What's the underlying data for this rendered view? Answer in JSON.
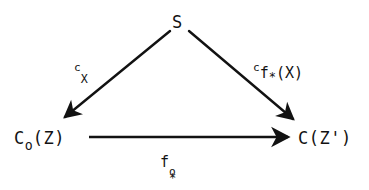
{
  "diagram": {
    "type": "commutative-triangle",
    "background_color": "#ffffff",
    "ink_color": "#121212",
    "nodes": [
      {
        "id": "top",
        "label_plain": "S",
        "base": "S",
        "position": {
          "x": 178,
          "y": 22
        }
      },
      {
        "id": "bottom-left",
        "label_plain": "C_o(Z)",
        "base": "C",
        "sub": "o",
        "tail": "(Z)",
        "position": {
          "x": 48,
          "y": 140
        }
      },
      {
        "id": "bottom-right",
        "label_plain": "C(Z')",
        "base": "C(Z')",
        "position": {
          "x": 330,
          "y": 140
        }
      }
    ],
    "arrows": [
      {
        "id": "left",
        "from": "top",
        "to": "bottom-left",
        "label_plain": "c_X",
        "presup": "c",
        "sub": "X",
        "head": "arrowhead-down-left"
      },
      {
        "id": "right",
        "from": "top",
        "to": "bottom-right",
        "label_plain": "c_{f_*(X)}",
        "presup": "c",
        "sub_base": "f",
        "sub_star": "*",
        "sub_tail": "(X)",
        "head": "arrowhead-down-right"
      },
      {
        "id": "bottom",
        "from": "bottom-left",
        "to": "bottom-right",
        "label_plain": "f^o_*",
        "base": "f",
        "sup": "o",
        "sub_star": "*",
        "head": "arrowhead-right"
      }
    ],
    "faint_artifacts": {
      "mark_1": "",
      "mark_2": ""
    }
  }
}
